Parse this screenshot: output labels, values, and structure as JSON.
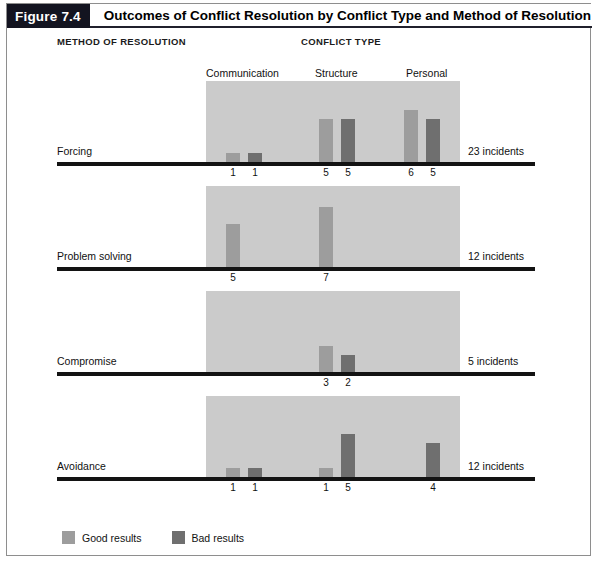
{
  "figure": {
    "number_label": "Figure 7.4",
    "title": "Outcomes of Conflict Resolution by Conflict Type and Method of Resolution"
  },
  "headings": {
    "method": "METHOD OF RESOLUTION",
    "conflict": "CONFLICT TYPE"
  },
  "legend": {
    "good_label": "Good results",
    "bad_label": "Bad results",
    "good_color": "#9d9d9d",
    "bad_color": "#6f6f6f"
  },
  "colors": {
    "plot_background": "#cbcbcb",
    "baseline": "#131313",
    "figure_tag_background": "#131420",
    "frame_border": "#8e8e8e"
  },
  "chart_data": {
    "type": "bar",
    "title": "Outcomes of Conflict Resolution by Conflict Type and Method of Resolution",
    "xlabel": "CONFLICT TYPE",
    "ylabel": "METHOD OF RESOLUTION",
    "grid": false,
    "legend_position": "bottom-left",
    "categories": [
      "Communication",
      "Structure",
      "Personal"
    ],
    "series": [
      {
        "name": "Good results",
        "color": "#9d9d9d"
      },
      {
        "name": "Bad results",
        "color": "#6f6f6f"
      }
    ],
    "ymax": 7,
    "panels": [
      {
        "method": "Forcing",
        "incidents": "23 incidents",
        "groups": [
          {
            "category": "Communication",
            "good": 1,
            "bad": 1
          },
          {
            "category": "Structure",
            "good": 5,
            "bad": 5
          },
          {
            "category": "Personal",
            "good": 6,
            "bad": 5
          }
        ]
      },
      {
        "method": "Problem solving",
        "incidents": "12 incidents",
        "groups": [
          {
            "category": "Communication",
            "good": 5,
            "bad": null
          },
          {
            "category": "Structure",
            "good": 7,
            "bad": null
          },
          {
            "category": "Personal",
            "good": null,
            "bad": null
          }
        ]
      },
      {
        "method": "Compromise",
        "incidents": "5 incidents",
        "groups": [
          {
            "category": "Communication",
            "good": null,
            "bad": null
          },
          {
            "category": "Structure",
            "good": 3,
            "bad": 2
          },
          {
            "category": "Personal",
            "good": null,
            "bad": null
          }
        ]
      },
      {
        "method": "Avoidance",
        "incidents": "12 incidents",
        "groups": [
          {
            "category": "Communication",
            "good": 1,
            "bad": 1
          },
          {
            "category": "Structure",
            "good": 1,
            "bad": 5
          },
          {
            "category": "Personal",
            "good": null,
            "bad": 4
          }
        ]
      }
    ]
  }
}
